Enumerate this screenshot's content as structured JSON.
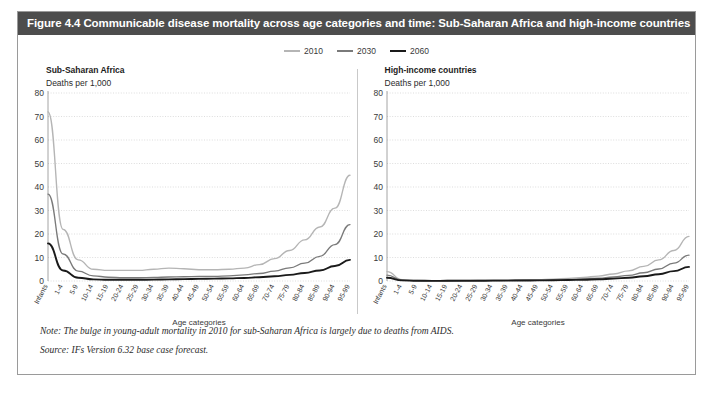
{
  "figure": {
    "title": "Figure 4.4 Communicable disease mortality across age categories and time: Sub-Saharan Africa and high-income countries",
    "note": "Note: The bulge in young-adult mortality in 2010 for sub-Saharan Africa is largely due to deaths from AIDS.",
    "source": "Source: IFs Version 6.32 base case forecast."
  },
  "legend": {
    "position": "top-center",
    "items": [
      {
        "label": "2010",
        "color": "#b5b5b5"
      },
      {
        "label": "2030",
        "color": "#7a7a7a"
      },
      {
        "label": "2060",
        "color": "#1a1a1a"
      }
    ]
  },
  "chart_data": [
    {
      "type": "line",
      "title": "Sub-Saharan Africa",
      "subtitle": "Deaths per 1,000",
      "ylabel": "Deaths per 1,000",
      "xlabel": "Age categories",
      "ylim": [
        0,
        80
      ],
      "yticks": [
        0,
        10,
        20,
        30,
        40,
        50,
        60,
        70,
        80
      ],
      "grid": true,
      "categories": [
        "Infants",
        "1-4",
        "5-9",
        "10-14",
        "15-19",
        "20-24",
        "25-29",
        "30-34",
        "35-39",
        "40-44",
        "45-49",
        "50-54",
        "55-59",
        "60-64",
        "65-69",
        "70-74",
        "75-79",
        "80-84",
        "85-89",
        "90-94",
        "95-99"
      ],
      "series": [
        {
          "name": "2010",
          "color": "#b5b5b5",
          "values": [
            72,
            22,
            9,
            5,
            4.5,
            4.5,
            4.5,
            5,
            5.5,
            5.2,
            4.8,
            4.8,
            5,
            5.5,
            7,
            9.5,
            13,
            17.5,
            23,
            31,
            45
          ]
        },
        {
          "name": "2030",
          "color": "#7a7a7a",
          "values": [
            37,
            11.5,
            4.2,
            2.2,
            1.6,
            1.4,
            1.4,
            1.5,
            1.7,
            1.8,
            1.9,
            2,
            2.2,
            2.6,
            3.2,
            4.2,
            5.6,
            7.6,
            10.5,
            15.5,
            24
          ]
        },
        {
          "name": "2060",
          "color": "#1a1a1a",
          "values": [
            16,
            4.5,
            1.4,
            0.7,
            0.5,
            0.5,
            0.5,
            0.6,
            0.7,
            0.8,
            0.9,
            1,
            1.1,
            1.3,
            1.6,
            2,
            2.6,
            3.4,
            4.5,
            6.4,
            9
          ]
        }
      ]
    },
    {
      "type": "line",
      "title": "High-income countries",
      "subtitle": "Deaths per 1,000",
      "ylabel": "Deaths per 1,000",
      "xlabel": "Age categories",
      "ylim": [
        0,
        80
      ],
      "yticks": [
        0,
        10,
        20,
        30,
        40,
        50,
        60,
        70,
        80
      ],
      "grid": true,
      "categories": [
        "Infants",
        "1-4",
        "5-9",
        "10-14",
        "15-19",
        "20-24",
        "25-29",
        "30-34",
        "35-39",
        "40-44",
        "45-49",
        "50-54",
        "55-59",
        "60-64",
        "65-69",
        "70-74",
        "75-79",
        "80-84",
        "85-89",
        "90-94",
        "95-99"
      ],
      "series": [
        {
          "name": "2010",
          "color": "#b5b5b5",
          "values": [
            4,
            0.6,
            0.2,
            0.15,
            0.2,
            0.25,
            0.3,
            0.35,
            0.4,
            0.5,
            0.6,
            0.8,
            1.1,
            1.5,
            2.1,
            3,
            4.3,
            6.2,
            9,
            13,
            19
          ]
        },
        {
          "name": "2030",
          "color": "#7a7a7a",
          "values": [
            2.5,
            0.4,
            0.15,
            0.1,
            0.12,
            0.15,
            0.18,
            0.2,
            0.25,
            0.3,
            0.4,
            0.5,
            0.7,
            0.9,
            1.2,
            1.7,
            2.4,
            3.5,
            5.1,
            7.6,
            11
          ]
        },
        {
          "name": "2060",
          "color": "#1a1a1a",
          "values": [
            1.4,
            0.25,
            0.1,
            0.07,
            0.08,
            0.1,
            0.12,
            0.14,
            0.17,
            0.2,
            0.25,
            0.32,
            0.42,
            0.55,
            0.75,
            1,
            1.4,
            2,
            2.9,
            4.2,
            6
          ]
        }
      ]
    }
  ]
}
